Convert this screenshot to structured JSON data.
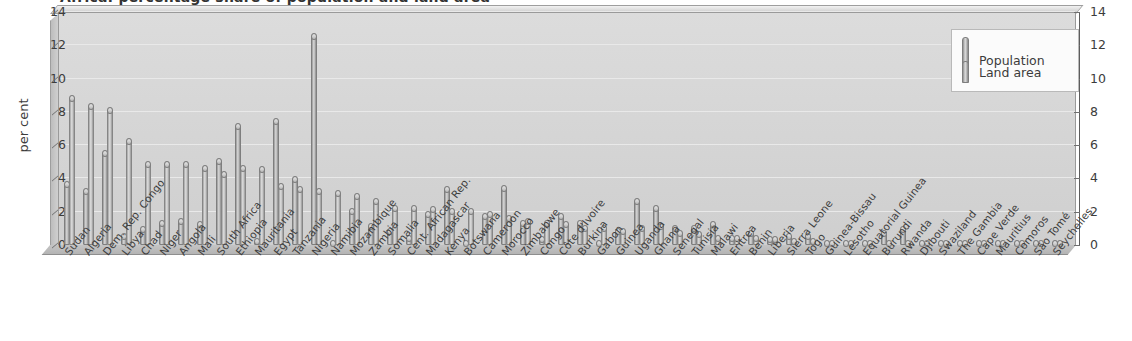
{
  "chart": {
    "title": "Africa: percentage share of population and land area",
    "y_axis_label": "per cent",
    "y_ticks": [
      0,
      2,
      4,
      6,
      8,
      10,
      12,
      14
    ]
  },
  "legend": {
    "position": "top-right",
    "items": [
      {
        "label": "Population",
        "swatch": "population-swatch"
      },
      {
        "label": "Land area",
        "swatch": "land-area-swatch"
      }
    ]
  },
  "chart_data": {
    "type": "bar",
    "title": "Africa: percentage share of population and land area",
    "xlabel": "",
    "ylabel": "per cent",
    "ylim": [
      0,
      14
    ],
    "yticks": [
      0,
      2,
      4,
      6,
      8,
      10,
      12,
      14
    ],
    "grid": true,
    "legend_position": "top-right",
    "categories": [
      "Sudan",
      "Algeria",
      "Dem. Rep. Congo",
      "Libya",
      "Chad",
      "Niger",
      "Angola",
      "Mali",
      "South Africa",
      "Ethiopia",
      "Mauritania",
      "Egypt",
      "Tanzania",
      "Nigeria",
      "Namibia",
      "Mozambique",
      "Zambia",
      "Somalia",
      "Cent. African Rep.",
      "Madagascar",
      "Kenya",
      "Botswana",
      "Cameroon",
      "Morocco",
      "Zimbabwe",
      "Congo",
      "Côte d'Ivoire",
      "Burkina",
      "Gabon",
      "Guinea",
      "Uganda",
      "Ghana",
      "Senegal",
      "Tunisia",
      "Malawi",
      "Eritrea",
      "Benin",
      "Liberia",
      "Sierra Leone",
      "Togo",
      "Guinea-Bissau",
      "Lesotho",
      "Equatorial Guinea",
      "Burundi",
      "Rwanda",
      "Djibouti",
      "Swaziland",
      "The Gambia",
      "Cape Verde",
      "Mauritius",
      "Comoros",
      "São Tomé",
      "Seychelles"
    ],
    "series": [
      {
        "name": "Population",
        "values": [
          3.7,
          3.3,
          5.6,
          0.6,
          1.0,
          1.4,
          1.5,
          1.3,
          5.1,
          7.2,
          0.3,
          7.5,
          4.0,
          12.6,
          0.2,
          2.1,
          1.2,
          0.9,
          0.5,
          1.9,
          3.4,
          0.2,
          1.8,
          3.5,
          1.4,
          0.4,
          1.8,
          1.4,
          0.2,
          0.9,
          2.7,
          2.3,
          1.1,
          1.1,
          1.3,
          0.5,
          0.8,
          0.4,
          0.6,
          0.6,
          0.2,
          0.2,
          0.1,
          0.8,
          1.0,
          0.1,
          0.1,
          0.2,
          0.1,
          0.2,
          0.1,
          0.03,
          0.01
        ]
      },
      {
        "name": "Land area",
        "values": [
          8.9,
          8.4,
          8.2,
          6.3,
          4.9,
          4.9,
          4.9,
          4.7,
          4.3,
          4.7,
          4.6,
          3.6,
          3.4,
          3.3,
          3.2,
          3.0,
          2.7,
          2.3,
          2.3,
          2.2,
          2.1,
          2.1,
          1.9,
          1.7,
          1.5,
          1.4,
          1.3,
          1.1,
          1.1,
          0.9,
          1.1,
          1.2,
          0.8,
          0.7,
          0.5,
          0.5,
          0.5,
          0.4,
          0.3,
          0.3,
          0.2,
          0.2,
          0.2,
          0.2,
          0.1,
          0.1,
          0.1,
          0.1,
          0.03,
          0.01,
          0.01,
          0.01,
          0.01
        ]
      }
    ]
  }
}
